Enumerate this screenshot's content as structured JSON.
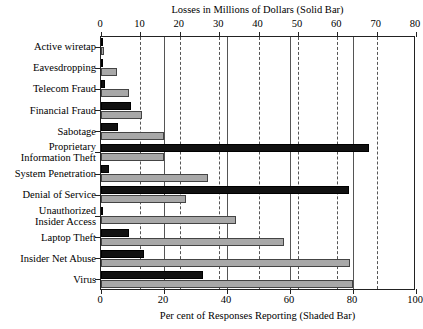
{
  "chart_data": {
    "type": "bar",
    "orientation": "horizontal",
    "title": "",
    "top_axis_label": "Losses in Millions of Dollars (Solid Bar)",
    "bottom_axis_label": "Per cent of Responses Reporting (Shaded Bar)",
    "top_axis_ticks": [
      0,
      10,
      20,
      30,
      40,
      50,
      60,
      70,
      80
    ],
    "bottom_axis_ticks": [
      0,
      20,
      40,
      60,
      80,
      100
    ],
    "top_xlim": [
      0,
      80
    ],
    "bottom_xlim": [
      0,
      100
    ],
    "grid": true,
    "legend": "none",
    "categories": [
      "Active wiretap",
      "Eavesdropping",
      "Telecom Fraud",
      "Financial Fraud",
      "Sabotage",
      "Proprietary\nInformation Theft",
      "System Penetration",
      "Denial of Service",
      "Unauthorized\nInsider Access",
      "Laptop Theft",
      "Insider Net Abuse",
      "Virus"
    ],
    "series": [
      {
        "name": "Losses in Millions of Dollars (Solid Bar)",
        "style": "solid",
        "color": "#111111",
        "axis": "top",
        "values": [
          0.3,
          0.0,
          1.0,
          7.6,
          4.3,
          68.0,
          2.0,
          63.0,
          0.4,
          7.0,
          11.0,
          26.0
        ]
      },
      {
        "name": "Per cent of Responses Reporting (Shaded Bar)",
        "style": "shaded",
        "color": "#a8a8a8",
        "axis": "bottom",
        "values": [
          1.0,
          5.0,
          9.0,
          13.0,
          20.0,
          20.0,
          34.0,
          27.0,
          43.0,
          58.0,
          79.0,
          80.0
        ]
      }
    ]
  },
  "labels": {
    "top_title": "Losses in Millions of Dollars (Solid Bar)",
    "bottom_title": "Per cent of Responses Reporting (Shaded Bar)",
    "categories": [
      {
        "line1": "Active wiretap",
        "line2": ""
      },
      {
        "line1": "Eavesdropping",
        "line2": ""
      },
      {
        "line1": "Telecom Fraud",
        "line2": ""
      },
      {
        "line1": "Financial Fraud",
        "line2": ""
      },
      {
        "line1": "Sabotage",
        "line2": ""
      },
      {
        "line1": "Proprietary",
        "line2": "Information Theft"
      },
      {
        "line1": "System Penetration",
        "line2": ""
      },
      {
        "line1": "Denial of Service",
        "line2": ""
      },
      {
        "line1": "Unauthorized",
        "line2": "Insider Access"
      },
      {
        "line1": "Laptop Theft",
        "line2": ""
      },
      {
        "line1": "Insider Net Abuse",
        "line2": ""
      },
      {
        "line1": "Virus",
        "line2": ""
      }
    ],
    "top_ticks": [
      "0",
      "10",
      "20",
      "30",
      "40",
      "50",
      "60",
      "70",
      "80"
    ],
    "bottom_ticks": [
      "0",
      "20",
      "40",
      "60",
      "80",
      "100"
    ]
  }
}
